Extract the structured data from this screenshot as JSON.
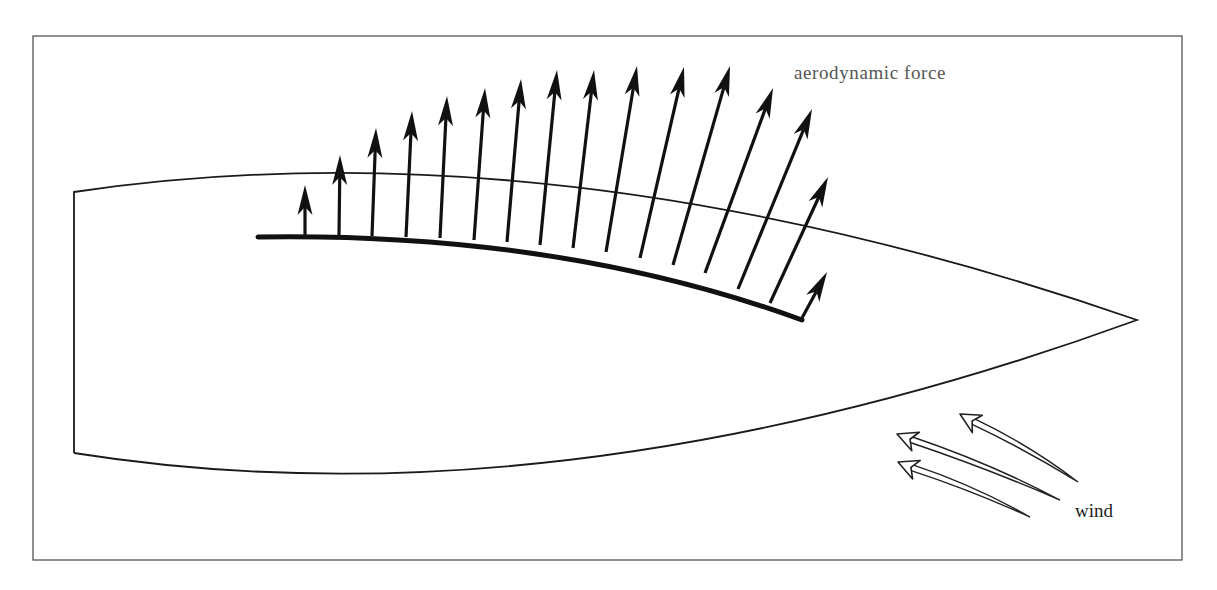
{
  "diagram": {
    "labels": {
      "force": "aerodynamic force",
      "wind": "wind"
    },
    "colors": {
      "frame": "#555555",
      "hull": "#1a1a1a",
      "sail": "#111111",
      "arrow": "#111111",
      "wind_arrow_fill": "#ffffff",
      "background": "#ffffff"
    },
    "frame": {
      "x1": 33,
      "y1": 36,
      "x2": 1182,
      "y2": 560
    },
    "hull": {
      "transom_top": [
        74,
        192
      ],
      "transom_bottom": [
        74,
        453
      ],
      "bow": [
        1137,
        320
      ],
      "deck_control": [
        560,
        120
      ],
      "bottom_control": [
        560,
        530
      ]
    },
    "sail_foot": {
      "start": [
        258,
        237
      ],
      "control": [
        560,
        232
      ],
      "end": [
        802,
        320
      ]
    },
    "force_arrows": [
      {
        "base": [
          305,
          236
        ],
        "tip": [
          305,
          185
        ]
      },
      {
        "base": [
          339,
          236
        ],
        "tip": [
          340,
          155
        ]
      },
      {
        "base": [
          372,
          236
        ],
        "tip": [
          376,
          128
        ]
      },
      {
        "base": [
          406,
          237
        ],
        "tip": [
          412,
          111
        ]
      },
      {
        "base": [
          440,
          238
        ],
        "tip": [
          447,
          96
        ]
      },
      {
        "base": [
          474,
          240
        ],
        "tip": [
          485,
          88
        ]
      },
      {
        "base": [
          507,
          242
        ],
        "tip": [
          521,
          79
        ]
      },
      {
        "base": [
          540,
          245
        ],
        "tip": [
          557,
          70
        ]
      },
      {
        "base": [
          573,
          248
        ],
        "tip": [
          594,
          70
        ]
      },
      {
        "base": [
          606,
          252
        ],
        "tip": [
          637,
          66
        ]
      },
      {
        "base": [
          640,
          258
        ],
        "tip": [
          684,
          67
        ]
      },
      {
        "base": [
          673,
          265
        ],
        "tip": [
          730,
          66
        ]
      },
      {
        "base": [
          705,
          273
        ],
        "tip": [
          773,
          88
        ]
      },
      {
        "base": [
          738,
          289
        ],
        "tip": [
          812,
          109
        ]
      },
      {
        "base": [
          770,
          303
        ],
        "tip": [
          828,
          177
        ]
      },
      {
        "base": [
          802,
          318
        ],
        "tip": [
          827,
          272
        ]
      }
    ],
    "wind_arrows": [
      {
        "tail": [
          1078,
          482
        ],
        "head": [
          960,
          414
        ]
      },
      {
        "tail": [
          1060,
          500
        ],
        "head": [
          897,
          434
        ]
      },
      {
        "tail": [
          1030,
          517
        ],
        "head": [
          898,
          462
        ]
      }
    ]
  }
}
